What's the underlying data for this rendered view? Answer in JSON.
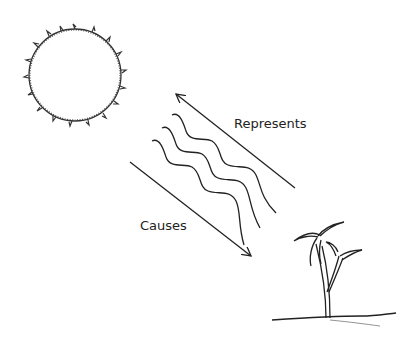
{
  "diagram": {
    "nodes": [
      {
        "id": "sun",
        "label": "",
        "icon": "sun-icon"
      },
      {
        "id": "light-waves",
        "label": "",
        "icon": "wave-icon"
      },
      {
        "id": "plant",
        "label": "",
        "icon": "seedling-icon"
      }
    ],
    "edges": [
      {
        "from": "plant",
        "to": "sun",
        "label": "Represents"
      },
      {
        "from": "sun",
        "to": "plant",
        "label": "Causes"
      }
    ]
  },
  "labels": {
    "represents": "Represents",
    "causes": "Causes"
  },
  "colors": {
    "stroke": "#222222",
    "background": "#ffffff"
  }
}
